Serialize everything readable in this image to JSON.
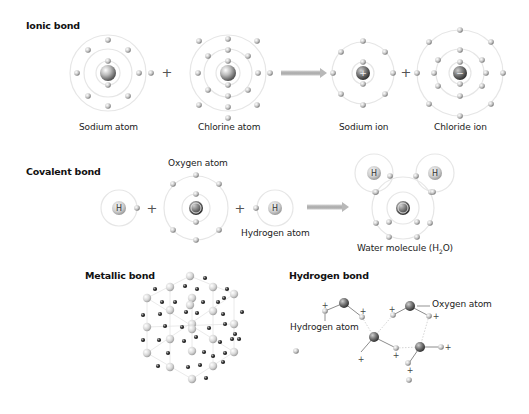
{
  "colors": {
    "shell": "#e6e6e6",
    "electron_light": "#f2f2f2",
    "electron_dark": "#7a7a7a",
    "nucleus_light": "#e0e0e0",
    "nucleus_dark": "#4a4a4a",
    "arrow": "#b8b8b8",
    "text": "#222222",
    "lattice_line": "#e4e4e4",
    "plus": "#555555"
  },
  "ionic": {
    "title": "Ionic bond",
    "title_pos": [
      26,
      27
    ],
    "plus_signs": [
      {
        "x": 167,
        "y": 73
      },
      {
        "x": 406,
        "y": 73
      }
    ],
    "arrow": {
      "x1": 281,
      "x2": 327,
      "y": 73
    },
    "atoms": [
      {
        "name": "sodium-atom",
        "label": "Sodium atom",
        "label_pos": [
          79,
          121
        ],
        "cx": 108,
        "cy": 73,
        "nucleus_r": 8,
        "nucleus_symbol": "",
        "shells": [
          12,
          24,
          38
        ],
        "electrons": [
          [
            108,
            61
          ],
          [
            108,
            85
          ],
          [
            88,
            50
          ],
          [
            128,
            50
          ],
          [
            108,
            40
          ],
          [
            88,
            96
          ],
          [
            128,
            96
          ],
          [
            108,
            106
          ],
          [
            77,
            73
          ],
          [
            139,
            73
          ],
          [
            151,
            73
          ]
        ]
      },
      {
        "name": "chlorine-atom",
        "label": "Chlorine atom",
        "label_pos": [
          198,
          121
        ],
        "cx": 228,
        "cy": 73,
        "nucleus_r": 8,
        "nucleus_symbol": "",
        "shells": [
          12,
          24,
          38
        ],
        "electrons": [
          [
            228,
            61
          ],
          [
            228,
            85
          ],
          [
            228,
            50
          ],
          [
            228,
            96
          ],
          [
            208,
            56
          ],
          [
            248,
            56
          ],
          [
            208,
            90
          ],
          [
            248,
            90
          ],
          [
            228,
            39
          ],
          [
            228,
            107
          ],
          [
            198,
            73
          ],
          [
            258,
            73
          ],
          [
            270,
            73
          ],
          [
            199,
            41
          ],
          [
            257,
            41
          ],
          [
            199,
            105
          ],
          [
            257,
            105
          ],
          [
            228,
            118
          ]
        ]
      },
      {
        "name": "sodium-ion",
        "label": "Sodium ion",
        "label_pos": [
          339,
          121
        ],
        "cx": 363,
        "cy": 73,
        "nucleus_r": 7,
        "nucleus_symbol": "+",
        "shells": [
          11,
          31
        ],
        "electrons": [
          [
            363,
            62
          ],
          [
            363,
            84
          ],
          [
            363,
            41
          ],
          [
            363,
            105
          ],
          [
            341,
            52
          ],
          [
            385,
            52
          ],
          [
            341,
            94
          ],
          [
            385,
            94
          ],
          [
            333,
            73
          ],
          [
            393,
            73
          ]
        ]
      },
      {
        "name": "chloride-ion",
        "label": "Chloride ion",
        "label_pos": [
          454,
          121
        ],
        "cx": 460,
        "cy": 73,
        "nucleus_r": 7,
        "nucleus_symbol": "−",
        "shells": [
          11,
          24,
          43
        ],
        "electrons": [
          [
            460,
            62
          ],
          [
            460,
            84
          ],
          [
            460,
            50
          ],
          [
            460,
            96
          ],
          [
            438,
            60
          ],
          [
            482,
            60
          ],
          [
            438,
            86
          ],
          [
            482,
            86
          ],
          [
            434,
            73
          ],
          [
            486,
            73
          ],
          [
            417,
            73
          ],
          [
            503,
            73
          ],
          [
            460,
            30
          ],
          [
            460,
            116
          ],
          [
            429,
            42
          ],
          [
            491,
            42
          ],
          [
            429,
            104
          ],
          [
            491,
            104
          ]
        ]
      }
    ]
  },
  "covalent": {
    "title": "Covalent bond",
    "title_pos": [
      26,
      173
    ],
    "plus_signs": [
      {
        "x": 152,
        "y": 209
      },
      {
        "x": 240,
        "y": 209
      }
    ],
    "arrow": {
      "x1": 307,
      "x2": 349,
      "y": 207
    },
    "atoms": [
      {
        "name": "hydrogen-atom-left",
        "label": "",
        "cx": 119,
        "cy": 208,
        "nucleus_r": 7,
        "nucleus_symbol": "H",
        "shells": [
          18
        ],
        "electrons": [
          [
            137,
            208
          ]
        ]
      },
      {
        "name": "oxygen-atom",
        "label": "Oxygen atom",
        "label_pos": [
          168,
          157
        ],
        "cx": 196,
        "cy": 208,
        "nucleus_r": 7,
        "nucleus_symbol": "O",
        "shells": [
          14,
          32
        ],
        "electrons": [
          [
            196,
            194
          ],
          [
            196,
            222
          ],
          [
            196,
            175
          ],
          [
            196,
            240
          ],
          [
            173,
            184
          ],
          [
            219,
            184
          ],
          [
            173,
            230
          ],
          [
            219,
            230
          ]
        ]
      },
      {
        "name": "hydrogen-atom-right",
        "label": "Hydrogen atom",
        "label_pos": [
          241,
          229
        ],
        "cx": 275,
        "cy": 208,
        "nucleus_r": 7,
        "nucleus_symbol": "H",
        "shells": [
          18
        ],
        "electrons": [
          [
            256,
            208
          ]
        ]
      },
      {
        "name": "water-molecule",
        "label": "Water molecule (H",
        "label_sub": "2",
        "label_suffix": "O)",
        "label_pos": [
          356,
          245
        ],
        "cx": 403,
        "cy": 208,
        "nucleus_r": 7,
        "nucleus_symbol": "O",
        "shells": [
          16,
          31
        ],
        "electrons": [
          [
            389,
            222
          ],
          [
            417,
            222
          ],
          [
            376,
            223
          ],
          [
            430,
            223
          ],
          [
            389,
            237
          ],
          [
            417,
            237
          ],
          [
            375,
            192
          ],
          [
            431,
            192
          ],
          [
            390,
            176
          ],
          [
            416,
            176
          ],
          [
            433,
            192
          ],
          [
            376,
            192
          ]
        ],
        "hydrogens": [
          {
            "cx": 374,
            "cy": 173,
            "r": 19
          },
          {
            "cx": 435,
            "cy": 173,
            "r": 19
          }
        ]
      }
    ]
  },
  "metallic": {
    "title": "Metallic bond",
    "title_pos": [
      85,
      275
    ],
    "lattice": {
      "big_ions": [
        [
          190,
          276
        ],
        [
          170,
          287
        ],
        [
          213,
          287
        ],
        [
          147,
          298
        ],
        [
          234,
          294
        ],
        [
          192,
          298
        ],
        [
          190,
          305
        ],
        [
          170,
          310
        ],
        [
          213,
          311
        ],
        [
          147,
          327
        ],
        [
          192,
          324
        ],
        [
          192,
          329
        ],
        [
          234,
          324
        ],
        [
          170,
          339
        ],
        [
          213,
          339
        ],
        [
          147,
          353
        ],
        [
          192,
          351
        ],
        [
          234,
          352
        ],
        [
          170,
          367
        ],
        [
          213,
          366
        ],
        [
          192,
          379
        ]
      ],
      "electrons": [
        [
          205,
          278
        ],
        [
          155,
          289
        ],
        [
          185,
          286
        ],
        [
          197,
          289
        ],
        [
          227,
          289
        ],
        [
          162,
          302
        ],
        [
          175,
          302
        ],
        [
          203,
          302
        ],
        [
          218,
          302
        ],
        [
          224,
          298
        ],
        [
          143,
          315
        ],
        [
          160,
          314
        ],
        [
          186,
          312
        ],
        [
          197,
          313
        ],
        [
          223,
          314
        ],
        [
          242,
          312
        ],
        [
          165,
          326
        ],
        [
          182,
          327
        ],
        [
          209,
          328
        ],
        [
          225,
          324
        ],
        [
          235,
          334
        ],
        [
          143,
          340
        ],
        [
          159,
          340
        ],
        [
          184,
          341
        ],
        [
          196,
          337
        ],
        [
          220,
          342
        ],
        [
          232,
          339
        ],
        [
          239,
          339
        ],
        [
          168,
          353
        ],
        [
          204,
          352
        ],
        [
          213,
          356
        ],
        [
          225,
          353
        ],
        [
          158,
          366
        ],
        [
          188,
          367
        ],
        [
          200,
          365
        ],
        [
          223,
          362
        ],
        [
          206,
          378
        ]
      ]
    }
  },
  "hydrogen_bond": {
    "title": "Hydrogen bond",
    "title_pos": [
      289,
      275
    ],
    "labels": [
      {
        "text": "Oxygen atom",
        "x": 432,
        "y": 299
      },
      {
        "text": "Hydrogen atom",
        "x": 290,
        "y": 326
      }
    ],
    "oxygens": [
      [
        344,
        303
      ],
      [
        410,
        306
      ],
      [
        374,
        337
      ],
      [
        420,
        347
      ]
    ],
    "hydrogens": [
      [
        325,
        311
      ],
      [
        362,
        317
      ],
      [
        393,
        315
      ],
      [
        429,
        316
      ],
      [
        296,
        351
      ],
      [
        396,
        348
      ],
      [
        408,
        363
      ],
      [
        441,
        347
      ],
      [
        409,
        380
      ]
    ],
    "bonds": [
      [
        325,
        311,
        344,
        303
      ],
      [
        344,
        303,
        362,
        317
      ],
      [
        393,
        315,
        410,
        306
      ],
      [
        410,
        306,
        429,
        316
      ],
      [
        374,
        337,
        396,
        348
      ],
      [
        374,
        337,
        361,
        352
      ],
      [
        420,
        347,
        441,
        347
      ],
      [
        420,
        347,
        409,
        363
      ]
    ],
    "hbonds": [
      [
        362,
        317,
        374,
        337
      ],
      [
        374,
        337,
        393,
        315
      ],
      [
        396,
        348,
        420,
        347
      ],
      [
        429,
        316,
        420,
        347
      ]
    ],
    "pluses": [
      [
        325,
        305
      ],
      [
        363,
        311
      ],
      [
        392,
        309
      ],
      [
        436,
        316
      ],
      [
        361,
        359
      ],
      [
        396,
        355
      ],
      [
        410,
        370
      ],
      [
        448,
        347
      ]
    ],
    "leaders": [
      [
        417,
        306,
        430,
        306
      ],
      [
        325,
        314,
        325,
        321
      ]
    ]
  }
}
